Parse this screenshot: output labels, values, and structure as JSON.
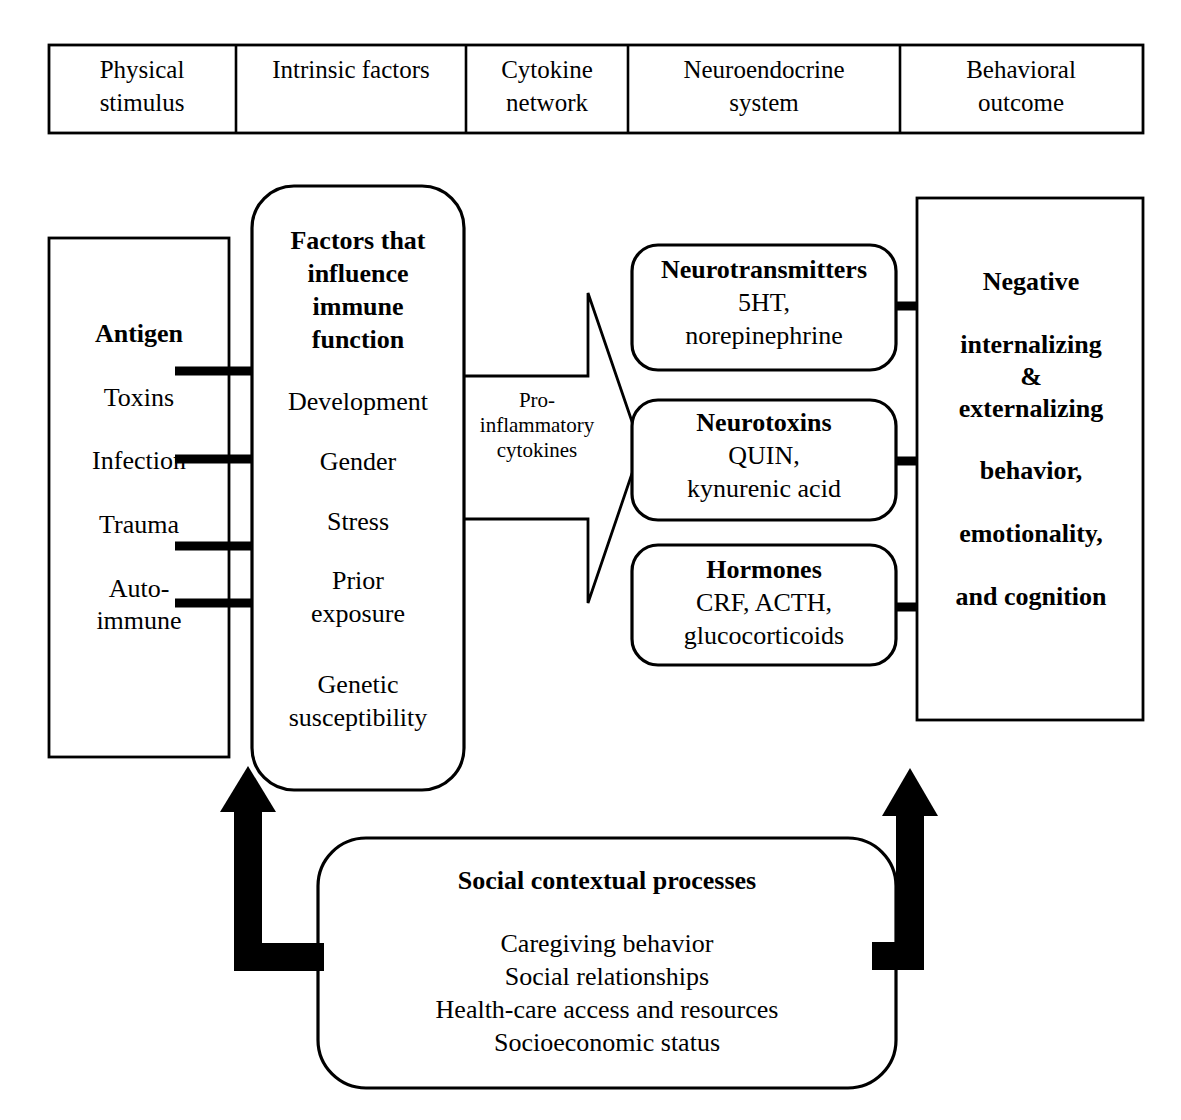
{
  "header": {
    "columns": [
      {
        "line1": "Physical",
        "line2": "stimulus"
      },
      {
        "line1": "Intrinsic factors",
        "line2": ""
      },
      {
        "line1": "Cytokine",
        "line2": "network"
      },
      {
        "line1": "Neuroendocrine",
        "line2": "system"
      },
      {
        "line1": "Behavioral",
        "line2": "outcome"
      }
    ]
  },
  "physical_stimulus_box": {
    "items": [
      {
        "text": "Antigen",
        "bold": true
      },
      {
        "text": "Toxins",
        "bold": false
      },
      {
        "text": "Infection",
        "bold": false
      },
      {
        "text": "Trauma",
        "bold": false
      },
      {
        "text": "Auto-",
        "bold": false
      },
      {
        "text": "immune",
        "bold": false
      }
    ]
  },
  "intrinsic_factors_box": {
    "title_lines": [
      "Factors that",
      "influence",
      "immune",
      "function"
    ],
    "items": [
      "Development",
      "Gender",
      "Stress",
      "Prior",
      "exposure",
      "Genetic",
      "susceptibility"
    ]
  },
  "cytokine_bracket": {
    "label_lines": [
      "Pro-",
      "inflammatory",
      "cytokines"
    ]
  },
  "neuroendocrine_boxes": [
    {
      "title": "Neurotransmitters",
      "lines": [
        "5HT,",
        "norepinephrine"
      ]
    },
    {
      "title": "Neurotoxins",
      "lines": [
        "QUIN,",
        "kynurenic acid"
      ]
    },
    {
      "title": "Hormones",
      "lines": [
        "CRF, ACTH,",
        "glucocorticoids"
      ]
    }
  ],
  "behavioral_outcome_box": {
    "lines": [
      "Negative",
      "internalizing",
      "&",
      "externalizing",
      "behavior,",
      "emotionality,",
      "and cognition"
    ]
  },
  "social_context_box": {
    "title": "Social contextual processes",
    "items": [
      "Caregiving behavior",
      "Social relationships",
      "Health-care access and resources",
      "Socioeconomic status"
    ]
  },
  "colors": {
    "stroke": "#000000",
    "background": "#ffffff"
  }
}
